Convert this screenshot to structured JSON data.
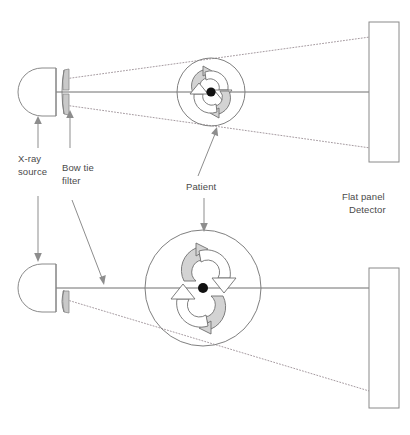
{
  "figure": {
    "type": "schematic-diagram",
    "background_color": "#ffffff",
    "line_color": "#808080",
    "beam_color": "#9b8f95",
    "fill_gray": "#d3d3d3",
    "dot_color": "#111111"
  },
  "labels": {
    "xray_source": {
      "line1": "X-ray",
      "line2": "source"
    },
    "bowtie_filter": {
      "line1": "Bow tie",
      "line2": "filter"
    },
    "patient": {
      "line1": "Patient"
    },
    "detector": {
      "line1": "Flat panel",
      "line2": "Detector"
    }
  },
  "panels": [
    {
      "name": "top-panel",
      "description": "Small patient: fan beam diverges past the patient and overfills the detector",
      "source": {
        "cx": 43,
        "cy": 92,
        "shape": "d-shape",
        "width": 26,
        "height": 48
      },
      "bowtie": {
        "x": 65,
        "y": 92,
        "shape": "hourglass",
        "half": "full"
      },
      "patient": {
        "cx": 211,
        "cy": 92,
        "r": 34
      },
      "detector": {
        "x": 369,
        "y": 22,
        "width": 30,
        "height": 140
      },
      "central_axis": {
        "x1": 43,
        "y1": 92,
        "x2": 369,
        "y2": 92
      },
      "beams": [
        {
          "from": [
            64,
            79
          ],
          "to": [
            399,
            33
          ]
        },
        {
          "from": [
            64,
            105
          ],
          "to": [
            399,
            152
          ]
        }
      ]
    },
    {
      "name": "bottom-panel",
      "description": "Large patient: only the lower fan beam edge is drawn, reaching the detector bottom",
      "source": {
        "cx": 43,
        "cy": 288,
        "shape": "d-shape",
        "width": 26,
        "height": 48
      },
      "bowtie": {
        "x": 65,
        "y": 288,
        "shape": "hourglass",
        "half": "lower"
      },
      "patient": {
        "cx": 203,
        "cy": 288,
        "r": 58
      },
      "detector": {
        "x": 369,
        "y": 268,
        "width": 30,
        "height": 140
      },
      "central_axis": {
        "x1": 43,
        "y1": 288,
        "x2": 369,
        "y2": 288
      },
      "beams": [
        {
          "from": [
            64,
            300
          ],
          "to": [
            399,
            400
          ]
        }
      ]
    }
  ],
  "annotations": [
    {
      "name": "xray-source-up",
      "from": [
        38,
        146
      ],
      "to": [
        38,
        116
      ],
      "direction": "up"
    },
    {
      "name": "xray-source-down",
      "from": [
        38,
        196
      ],
      "to": [
        38,
        260
      ],
      "direction": "down"
    },
    {
      "name": "bowtie-up",
      "from": [
        70,
        146
      ],
      "to": [
        70,
        110
      ],
      "direction": "up"
    },
    {
      "name": "bowtie-down",
      "from": [
        72,
        200
      ],
      "to": [
        104,
        283
      ],
      "direction": "down"
    },
    {
      "name": "patient-up",
      "from": [
        200,
        175
      ],
      "to": [
        216,
        128
      ],
      "direction": "up"
    },
    {
      "name": "patient-down",
      "from": [
        204,
        196
      ],
      "to": [
        204,
        232
      ],
      "direction": "down"
    }
  ],
  "label_positions": {
    "xray_source": {
      "x": 18,
      "y": 162
    },
    "bowtie_filter": {
      "x": 62,
      "y": 171
    },
    "patient": {
      "x": 186,
      "y": 190
    },
    "detector": {
      "x": 342,
      "y": 200
    }
  }
}
